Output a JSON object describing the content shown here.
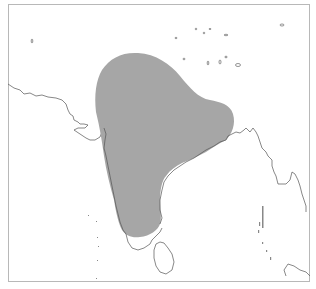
{
  "map": {
    "title": "",
    "region": "Indian subcontinent",
    "colors": {
      "background": "#ffffff",
      "range_fill": "#a6a6a6",
      "coastline": "#555555",
      "frame": "#b8b8b8"
    },
    "layers": [
      {
        "name": "distribution-range",
        "type": "polygon",
        "fill": "#a6a6a6"
      },
      {
        "name": "coastline",
        "type": "line"
      },
      {
        "name": "islands",
        "type": "points"
      }
    ],
    "features": [
      "Indian peninsula (shaded range)",
      "Sri Lanka",
      "Bay of Bengal",
      "Arabian Sea",
      "Lakshadweep islands",
      "Andaman and Nicobar Islands",
      "Myanmar coast",
      "Pakistan coast"
    ]
  }
}
